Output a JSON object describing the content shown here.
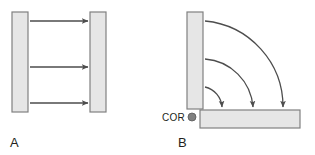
{
  "figure": {
    "width": 315,
    "height": 155,
    "background": "#ffffff",
    "panels": [
      {
        "id": "A",
        "label": "A",
        "label_x": 10,
        "label_y": 147,
        "caption_kind": "translation"
      },
      {
        "id": "B",
        "label": "B",
        "label_x": 178,
        "label_y": 147,
        "caption_kind": "rotation"
      }
    ]
  },
  "colors": {
    "block_fill": "#e6e6e6",
    "block_stroke": "#808080",
    "arrow_stroke": "#4d4d4d",
    "text": "#231f20",
    "cor_dot_fill": "#808080",
    "cor_dot_stroke": "#595959",
    "background": "#ffffff"
  },
  "panel_a": {
    "left_block": {
      "x": 12,
      "y": 12,
      "width": 16,
      "height": 100
    },
    "right_block": {
      "x": 90,
      "y": 12,
      "width": 16,
      "height": 100
    },
    "arrows": [
      {
        "x1": 30,
        "y1": 21,
        "x2": 88,
        "y2": 21
      },
      {
        "x1": 30,
        "y1": 67,
        "x2": 88,
        "y2": 67
      },
      {
        "x1": 30,
        "y1": 103,
        "x2": 88,
        "y2": 103
      }
    ]
  },
  "panel_b": {
    "vertical_block": {
      "x": 187,
      "y": 12,
      "width": 16,
      "height": 97
    },
    "horizontal_block": {
      "x": 200,
      "y": 110,
      "width": 100,
      "height": 18
    },
    "cor": {
      "label": "COR",
      "label_x": 162,
      "label_y": 121,
      "dot_cx": 192,
      "dot_cy": 117,
      "dot_r": 4
    },
    "arcs": [
      {
        "start_x": 205,
        "start_y": 21,
        "end_x": 283,
        "end_y": 107,
        "radius": 86
      },
      {
        "start_x": 205,
        "start_y": 59,
        "end_x": 253,
        "end_y": 107,
        "radius": 52
      },
      {
        "start_x": 205,
        "start_y": 87,
        "end_x": 222,
        "end_y": 107,
        "radius": 22
      }
    ]
  }
}
